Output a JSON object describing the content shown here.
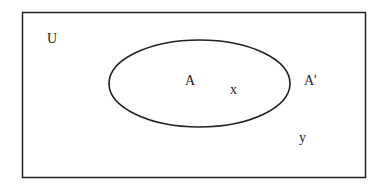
{
  "diagram": {
    "type": "venn",
    "universe": {
      "label": "U"
    },
    "set": {
      "label": "A",
      "complement_label": "A'"
    },
    "elements": [
      {
        "label": "x",
        "region": "A"
      },
      {
        "label": "y",
        "region": "A'"
      }
    ],
    "colors": {
      "stroke": "#222222",
      "background": "#ffffff"
    }
  }
}
